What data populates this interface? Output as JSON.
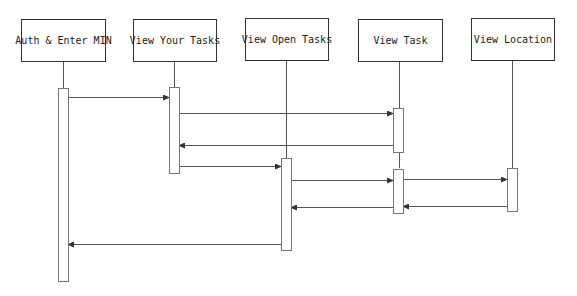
{
  "diagram": {
    "type": "sequence",
    "participants": [
      {
        "id": "auth",
        "label": "Auth & Enter MIN",
        "x": 21,
        "y": 19,
        "w": 85,
        "h": 43,
        "lifeline_x": 63
      },
      {
        "id": "your_tasks",
        "label": "View Your Tasks",
        "x": 133,
        "y": 19,
        "w": 84,
        "h": 43,
        "lifeline_x": 174
      },
      {
        "id": "open_tasks",
        "label": "View Open Tasks",
        "x": 245,
        "y": 18,
        "w": 84,
        "h": 43,
        "lifeline_x": 286
      },
      {
        "id": "view_task",
        "label": "View Task",
        "x": 358,
        "y": 19,
        "w": 85,
        "h": 43,
        "lifeline_x": 399
      },
      {
        "id": "view_location",
        "label": "View Location",
        "x": 471,
        "y": 18,
        "w": 84,
        "h": 43,
        "lifeline_x": 512
      }
    ],
    "lifeline_end_y": 168,
    "activations": [
      {
        "participant": "auth",
        "x": 58,
        "y": 88,
        "w": 10,
        "h": 193
      },
      {
        "participant": "your_tasks",
        "x": 169,
        "y": 87,
        "w": 10,
        "h": 86
      },
      {
        "participant": "open_tasks",
        "x": 281,
        "y": 158,
        "w": 10,
        "h": 92
      },
      {
        "participant": "view_task",
        "x": 393,
        "y": 108,
        "w": 10,
        "h": 44
      },
      {
        "participant": "view_task",
        "x": 393,
        "y": 169,
        "w": 10,
        "h": 44
      },
      {
        "participant": "view_location",
        "x": 507,
        "y": 168,
        "w": 10,
        "h": 43
      }
    ],
    "messages": [
      {
        "from": "auth",
        "to": "your_tasks",
        "x1": 68,
        "x2": 169,
        "y": 97
      },
      {
        "from": "your_tasks",
        "to": "view_task",
        "x1": 179,
        "x2": 393,
        "y": 113
      },
      {
        "from": "view_task",
        "to": "your_tasks",
        "x1": 393,
        "x2": 179,
        "y": 145
      },
      {
        "from": "your_tasks",
        "to": "open_tasks",
        "x1": 179,
        "x2": 281,
        "y": 166
      },
      {
        "from": "open_tasks",
        "to": "view_task",
        "x1": 291,
        "x2": 393,
        "y": 180
      },
      {
        "from": "view_task",
        "to": "view_location",
        "x1": 403,
        "x2": 507,
        "y": 179
      },
      {
        "from": "view_task",
        "to": "open_tasks",
        "x1": 393,
        "x2": 291,
        "y": 207
      },
      {
        "from": "view_location",
        "to": "view_task",
        "x1": 507,
        "x2": 403,
        "y": 206
      },
      {
        "from": "open_tasks",
        "to": "auth",
        "x1": 281,
        "x2": 68,
        "y": 244
      }
    ],
    "colors": {
      "line": "#555555",
      "border": "#333333",
      "activation_border": "#777777"
    }
  }
}
